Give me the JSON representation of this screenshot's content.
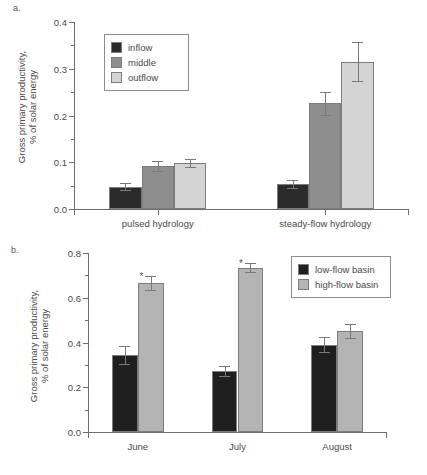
{
  "figure": {
    "panel_a_letter": "a.",
    "panel_b_letter": "b."
  },
  "chart_data": [
    {
      "type": "bar",
      "panel": "a",
      "title": "",
      "xlabel": "",
      "ylabel": "Gross primary productivity, % of solar energy",
      "ylabel_line1": "Gross primary productivity,",
      "ylabel_line2": "% of solar energy",
      "ylim": [
        0.0,
        0.4
      ],
      "ytick_labels": [
        "0.0",
        "0.1",
        "0.2",
        "0.3",
        "0.4"
      ],
      "ytick_values": [
        0.0,
        0.1,
        0.2,
        0.3,
        0.4
      ],
      "yminor_values": [
        0.05,
        0.15,
        0.25,
        0.35
      ],
      "grid": false,
      "legend_position": "upper-left-inside",
      "categories": [
        "pulsed hydrology",
        "steady-flow hydrology"
      ],
      "series": [
        {
          "name": "inflow",
          "color": "#2b2b2b",
          "values": [
            0.048,
            0.053
          ],
          "errors": [
            0.007,
            0.009
          ]
        },
        {
          "name": "middle",
          "color": "#8e8e8e",
          "values": [
            0.092,
            0.226
          ],
          "errors": [
            0.01,
            0.024
          ]
        },
        {
          "name": "outflow",
          "color": "#d4d4d4",
          "values": [
            0.099,
            0.315
          ],
          "errors": [
            0.009,
            0.042
          ]
        }
      ]
    },
    {
      "type": "bar",
      "panel": "b",
      "title": "",
      "xlabel": "",
      "ylabel": "Gross primary productivity, % of solar energy",
      "ylabel_line1": "Gross primary productivity,",
      "ylabel_line2": "% of solar energy",
      "ylim": [
        0.0,
        0.8
      ],
      "ytick_labels": [
        "0.0",
        "0.2",
        "0.4",
        "0.6",
        "0.8"
      ],
      "ytick_values": [
        0.0,
        0.2,
        0.4,
        0.6,
        0.8
      ],
      "yminor_values": [
        0.1,
        0.3,
        0.5,
        0.7
      ],
      "grid": false,
      "legend_position": "upper-right-inside",
      "categories": [
        "June",
        "July",
        "August"
      ],
      "significance_marker": "*",
      "series": [
        {
          "name": "low-flow basin",
          "color": "#1f1f1f",
          "values": [
            0.345,
            0.273,
            0.39
          ],
          "errors": [
            0.04,
            0.024,
            0.034
          ],
          "significant": [
            false,
            false,
            false
          ]
        },
        {
          "name": "high-flow basin",
          "color": "#b4b4b4",
          "values": [
            0.665,
            0.735,
            0.452
          ],
          "errors": [
            0.032,
            0.022,
            0.031
          ],
          "significant": [
            true,
            true,
            false
          ]
        }
      ]
    }
  ]
}
